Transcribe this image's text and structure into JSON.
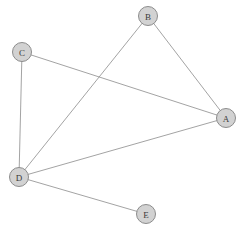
{
  "diagram": {
    "background_color": "#ffffff",
    "node_fill_color": "#d2d2d2",
    "node_stroke_color": "#8c8c8c",
    "node_label_color": "#3a3a3a",
    "edge_color": "#999999",
    "node_radius": 9.5,
    "nodes": [
      {
        "id": "A",
        "label": "A",
        "x": 226,
        "y": 118
      },
      {
        "id": "B",
        "label": "B",
        "x": 148,
        "y": 16
      },
      {
        "id": "C",
        "label": "C",
        "x": 22,
        "y": 52
      },
      {
        "id": "D",
        "label": "D",
        "x": 19,
        "y": 177
      },
      {
        "id": "E",
        "label": "E",
        "x": 146,
        "y": 214
      }
    ],
    "edges": [
      {
        "from": "B",
        "to": "A",
        "x1": 148,
        "y1": 16,
        "x2": 226,
        "y2": 118
      },
      {
        "from": "B",
        "to": "D",
        "x1": 148,
        "y1": 16,
        "x2": 19,
        "y2": 177
      },
      {
        "from": "C",
        "to": "A",
        "x1": 22,
        "y1": 52,
        "x2": 226,
        "y2": 118
      },
      {
        "from": "C",
        "to": "D",
        "x1": 22,
        "y1": 52,
        "x2": 19,
        "y2": 177
      },
      {
        "from": "D",
        "to": "A",
        "x1": 19,
        "y1": 177,
        "x2": 226,
        "y2": 118
      },
      {
        "from": "D",
        "to": "E",
        "x1": 19,
        "y1": 177,
        "x2": 146,
        "y2": 214
      }
    ]
  }
}
